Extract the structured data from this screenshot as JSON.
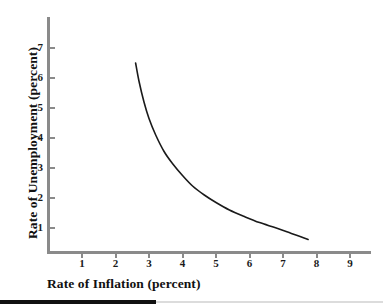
{
  "chart_data": {
    "type": "line",
    "title": "",
    "subtitle": "",
    "xlabel": "Rate of Inflation (percent)",
    "ylabel": "Rate of Unemployment (percent)",
    "xlim": [
      0,
      9.6
    ],
    "ylim": [
      0,
      7.8
    ],
    "xticks": [
      1,
      2,
      3,
      4,
      5,
      6,
      7,
      8,
      9
    ],
    "yticks": [
      1,
      2,
      3,
      4,
      5,
      6,
      7
    ],
    "xtick_labels": [
      "1",
      "2",
      "3",
      "4",
      "5",
      "6",
      "7",
      "8",
      "9"
    ],
    "ytick_labels": [
      "1",
      "2",
      "3",
      "4",
      "5",
      "6",
      "7"
    ],
    "grid": false,
    "legend": null,
    "legend_position": "none",
    "annotations": [],
    "series": [
      {
        "name": "Phillips curve",
        "color": "#1a1a1a",
        "line_width": 1.6,
        "x": [
          2.6,
          2.7,
          2.85,
          3.0,
          3.2,
          3.45,
          3.7,
          4.0,
          4.3,
          4.65,
          5.0,
          5.4,
          5.85,
          6.3,
          6.8,
          7.25,
          7.75
        ],
        "y": [
          6.5,
          5.9,
          5.2,
          4.65,
          4.1,
          3.55,
          3.15,
          2.75,
          2.4,
          2.1,
          1.85,
          1.6,
          1.38,
          1.18,
          1.0,
          0.82,
          0.62
        ]
      }
    ]
  },
  "axes": {
    "axis_color": "#8a8a8a",
    "tick_color": "#8a8a8a",
    "label_color": "#1a1a1a",
    "title_color": "#111111"
  },
  "footer": {
    "dark_rule_color": "#111111",
    "light_rule_color": "#dcdcdc"
  },
  "background": "#ffffff"
}
